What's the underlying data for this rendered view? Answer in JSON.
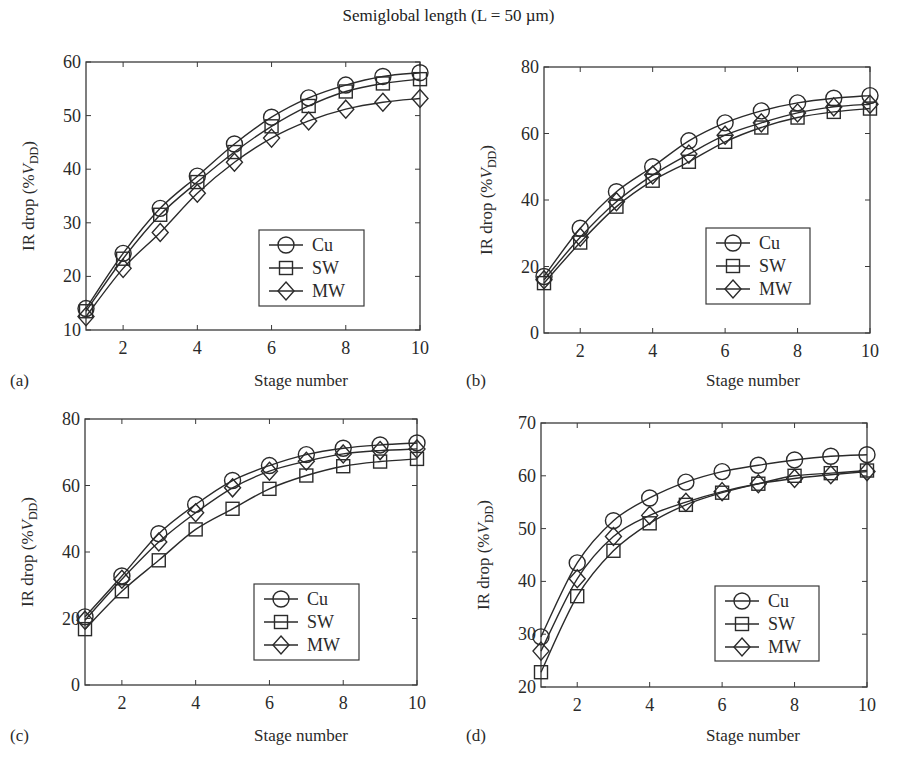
{
  "figure": {
    "title": "Semiglobal length (L = 50 µm)"
  },
  "colors": {
    "line": "#2b2b2b",
    "axis": "#3a3a3a",
    "background": "#ffffff"
  },
  "chart_data": [
    {
      "type": "line",
      "panel": "(a)",
      "title": "",
      "xlabel": "Stage number",
      "ylabel": "IR drop (%V_DD)",
      "x": [
        1,
        2,
        3,
        4,
        5,
        6,
        7,
        8,
        9,
        10
      ],
      "xticks": [
        2,
        4,
        6,
        8,
        10
      ],
      "xlim": [
        1,
        10
      ],
      "ylim": [
        10,
        60
      ],
      "yticks": [
        10,
        20,
        30,
        40,
        50,
        60
      ],
      "grid": false,
      "legend_position": "lower right",
      "series": [
        {
          "name": "Cu",
          "marker": "circle",
          "values": [
            14.0,
            24.3,
            32.7,
            38.7,
            44.7,
            49.7,
            53.3,
            55.7,
            57.3,
            58.0
          ]
        },
        {
          "name": "SW",
          "marker": "square",
          "values": [
            13.5,
            23.3,
            31.5,
            37.6,
            43.2,
            48.0,
            51.8,
            54.5,
            56.0,
            56.8
          ]
        },
        {
          "name": "MW",
          "marker": "diamond",
          "values": [
            12.5,
            21.5,
            28.2,
            35.5,
            41.3,
            45.8,
            49.0,
            51.2,
            52.5,
            53.2
          ]
        }
      ],
      "box": {
        "x0": 86,
        "y0": 62,
        "x1": 420,
        "y1": 330
      },
      "legend_box": {
        "x": 259,
        "y": 230,
        "w": 105,
        "h": 76
      },
      "panel_label_pos": {
        "x": 10,
        "y": 386
      },
      "xlabel_pos": {
        "x": 254,
        "y": 386
      }
    },
    {
      "type": "line",
      "panel": "(b)",
      "title": "",
      "xlabel": "Stage number",
      "ylabel": "IR drop (%V_DD)",
      "x": [
        1,
        2,
        3,
        4,
        5,
        6,
        7,
        8,
        9,
        10
      ],
      "xticks": [
        2,
        4,
        6,
        8,
        10
      ],
      "xlim": [
        1,
        10
      ],
      "ylim": [
        0,
        80
      ],
      "yticks": [
        0,
        20,
        40,
        60,
        80
      ],
      "grid": false,
      "legend_position": "lower right",
      "series": [
        {
          "name": "Cu",
          "marker": "circle",
          "values": [
            17.0,
            31.5,
            42.5,
            50.0,
            57.8,
            63.2,
            66.8,
            69.2,
            70.6,
            71.4
          ]
        },
        {
          "name": "SW",
          "marker": "square",
          "values": [
            15.0,
            27.2,
            38.0,
            45.8,
            51.5,
            57.5,
            61.8,
            64.8,
            66.5,
            67.5
          ]
        },
        {
          "name": "MW",
          "marker": "diamond",
          "values": [
            16.0,
            28.8,
            39.5,
            47.5,
            53.8,
            59.5,
            63.2,
            66.2,
            68.0,
            68.8
          ]
        }
      ],
      "box": {
        "x0": 544,
        "y0": 67,
        "x1": 870,
        "y1": 333
      },
      "legend_box": {
        "x": 706,
        "y": 228,
        "w": 104,
        "h": 76
      },
      "panel_label_pos": {
        "x": 466,
        "y": 386
      },
      "xlabel_pos": {
        "x": 706,
        "y": 386
      }
    },
    {
      "type": "line",
      "panel": "(c)",
      "title": "",
      "xlabel": "Stage number",
      "ylabel": "IR drop (%V_DD)",
      "x": [
        1,
        2,
        3,
        4,
        5,
        6,
        7,
        8,
        9,
        10
      ],
      "xticks": [
        2,
        4,
        6,
        8,
        10
      ],
      "xlim": [
        1,
        10
      ],
      "ylim": [
        0,
        80
      ],
      "yticks": [
        0,
        20,
        40,
        60,
        80
      ],
      "grid": false,
      "legend_position": "lower right",
      "series": [
        {
          "name": "Cu",
          "marker": "circle",
          "values": [
            20.5,
            32.8,
            45.5,
            54.3,
            61.5,
            66.0,
            69.3,
            71.2,
            72.2,
            72.8
          ]
        },
        {
          "name": "SW",
          "marker": "square",
          "values": [
            16.8,
            28.2,
            37.5,
            46.8,
            53.0,
            59.0,
            63.0,
            65.8,
            67.2,
            68.0
          ]
        },
        {
          "name": "MW",
          "marker": "diamond",
          "values": [
            19.5,
            31.8,
            43.0,
            51.8,
            59.3,
            64.3,
            67.3,
            69.5,
            70.5,
            71.0
          ]
        }
      ],
      "box": {
        "x0": 85,
        "y0": 419,
        "x1": 417,
        "y1": 685
      },
      "legend_box": {
        "x": 254,
        "y": 584,
        "w": 105,
        "h": 76
      },
      "panel_label_pos": {
        "x": 10,
        "y": 741
      },
      "xlabel_pos": {
        "x": 254,
        "y": 741
      }
    },
    {
      "type": "line",
      "panel": "(d)",
      "title": "",
      "xlabel": "Stage number",
      "ylabel": "IR drop (%V_DD)",
      "x": [
        1,
        2,
        3,
        4,
        5,
        6,
        7,
        8,
        9,
        10
      ],
      "xticks": [
        2,
        4,
        6,
        8,
        10
      ],
      "xlim": [
        1,
        10
      ],
      "ylim": [
        20,
        70
      ],
      "yticks": [
        20,
        30,
        40,
        50,
        60,
        70
      ],
      "grid": false,
      "legend_position": "lower right",
      "series": [
        {
          "name": "Cu",
          "marker": "circle",
          "values": [
            29.5,
            43.5,
            51.5,
            55.8,
            58.8,
            60.8,
            62.0,
            63.0,
            63.7,
            64.0
          ]
        },
        {
          "name": "SW",
          "marker": "square",
          "values": [
            22.8,
            37.2,
            45.8,
            51.0,
            54.5,
            56.8,
            58.5,
            60.0,
            60.5,
            61.0
          ]
        },
        {
          "name": "MW",
          "marker": "diamond",
          "values": [
            26.8,
            40.5,
            48.5,
            52.5,
            55.0,
            57.0,
            58.5,
            59.5,
            60.2,
            60.8
          ]
        }
      ],
      "box": {
        "x0": 541,
        "y0": 423,
        "x1": 867,
        "y1": 687
      },
      "legend_box": {
        "x": 715,
        "y": 586,
        "w": 104,
        "h": 75
      },
      "panel_label_pos": {
        "x": 466,
        "y": 741
      },
      "xlabel_pos": {
        "x": 706,
        "y": 741
      }
    }
  ]
}
